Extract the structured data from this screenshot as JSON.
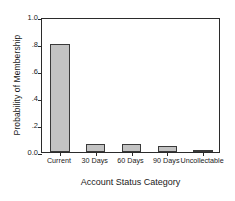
{
  "chart_data": {
    "type": "bar",
    "title": "",
    "xlabel": "Account Status Category",
    "ylabel": "Probability of Membership",
    "categories": [
      "Current",
      "30 Days",
      "60 Days",
      "90 Days",
      "Uncollectable"
    ],
    "values": [
      0.8,
      0.06,
      0.06,
      0.045,
      0.01
    ],
    "ylim": [
      0.0,
      1.0
    ],
    "ytick_labels": [
      "1.0",
      ".8",
      ".6",
      ".4",
      ".2",
      "0.0"
    ],
    "ytick_values": [
      1.0,
      0.8,
      0.6,
      0.4,
      0.2,
      0.0
    ],
    "grid": false,
    "legend": null,
    "bar_fill_color": "#c3c3c3",
    "bar_edge_color": "#3a3a3a",
    "axis_color": "#2b2b2b",
    "background_color": "#ffffff"
  }
}
